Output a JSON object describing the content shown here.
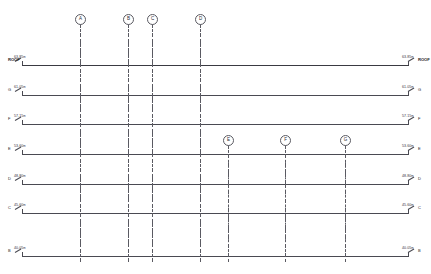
{
  "drawing": {
    "title": "Building Section - Level & Grid Diagram",
    "sheet_width": 431,
    "sheet_height": 274,
    "line_color": "#4a4a52",
    "grid_color": "#5a5a62",
    "text_color": "#33333b",
    "background": "#ffffff"
  },
  "levels": [
    {
      "tag": "ROOF",
      "tag_bold": true,
      "elevation": "63.85",
      "unit": "m",
      "y": 65
    },
    {
      "tag": "G",
      "tag_bold": false,
      "elevation": "61.05",
      "unit": "m",
      "y": 95
    },
    {
      "tag": "F",
      "tag_bold": false,
      "elevation": "57.15",
      "unit": "m",
      "y": 124
    },
    {
      "tag": "E",
      "tag_bold": false,
      "elevation": "53.60",
      "unit": "m",
      "y": 154
    },
    {
      "tag": "D",
      "tag_bold": false,
      "elevation": "48.80",
      "unit": "m",
      "y": 184
    },
    {
      "tag": "C",
      "tag_bold": false,
      "elevation": "45.60",
      "unit": "m",
      "y": 213
    },
    {
      "tag": "B",
      "tag_bold": false,
      "elevation": "40.05",
      "unit": "m",
      "y": 256
    }
  ],
  "grid_lines": [
    {
      "label": "A",
      "x": 80,
      "bubble_y": 19,
      "top": 24,
      "bottom": 262
    },
    {
      "label": "B",
      "x": 128,
      "bubble_y": 19,
      "top": 24,
      "bottom": 262
    },
    {
      "label": "C",
      "x": 152,
      "bubble_y": 19,
      "top": 24,
      "bottom": 262
    },
    {
      "label": "D",
      "x": 200,
      "bubble_y": 19,
      "top": 24,
      "bottom": 262
    },
    {
      "label": "E",
      "x": 228,
      "bubble_y": 140,
      "top": 145,
      "bottom": 262
    },
    {
      "label": "F",
      "x": 285,
      "bubble_y": 140,
      "top": 145,
      "bottom": 262
    },
    {
      "label": "G",
      "x": 345,
      "bubble_y": 140,
      "top": 145,
      "bottom": 262
    }
  ],
  "annotations": {
    "left_margin_x": 8,
    "right_margin_x": 402
  }
}
